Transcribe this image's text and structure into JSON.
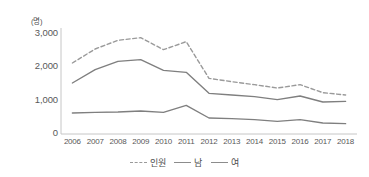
{
  "chart_data": {
    "type": "line",
    "title": "",
    "xlabel": "",
    "ylabel": "",
    "y_unit_label": "(명)",
    "categories": [
      "2006",
      "2007",
      "2008",
      "2009",
      "2010",
      "2011",
      "2012",
      "2013",
      "2014",
      "2015",
      "2016",
      "2017",
      "2018"
    ],
    "ylim": [
      0,
      3000
    ],
    "yticks": [
      "0",
      "1,000",
      "2,000",
      "3,000"
    ],
    "ytick_values": [
      0,
      1000,
      2000,
      3000
    ],
    "grid": false,
    "legend_position": "bottom",
    "series": [
      {
        "name": "인원",
        "style": "dashed",
        "color": "#9a9a9a",
        "values": [
          2100,
          2520,
          2780,
          2860,
          2500,
          2740,
          1640,
          1540,
          1450,
          1350,
          1450,
          1210,
          1140
        ]
      },
      {
        "name": "남",
        "style": "solid",
        "color": "#7f7f7f",
        "values": [
          1500,
          1900,
          2150,
          2200,
          1880,
          1820,
          1190,
          1140,
          1090,
          1000,
          1110,
          930,
          950
        ]
      },
      {
        "name": "여",
        "style": "solid",
        "color": "#7f7f7f",
        "values": [
          600,
          620,
          630,
          660,
          620,
          830,
          450,
          430,
          400,
          350,
          400,
          300,
          280
        ]
      }
    ]
  },
  "axis": {
    "unit": "(명)",
    "y_labels": [
      "3,000",
      "2,000",
      "1,000",
      "0"
    ],
    "x_labels": [
      "2006",
      "2007",
      "2008",
      "2009",
      "2010",
      "2011",
      "2012",
      "2013",
      "2014",
      "2015",
      "2016",
      "2017",
      "2018"
    ]
  },
  "legend": {
    "items": [
      {
        "label": "인원",
        "style": "dashed"
      },
      {
        "label": "남",
        "style": "solid"
      },
      {
        "label": "여",
        "style": "solid"
      }
    ]
  },
  "colors": {
    "axis_line": "#bfbfbf",
    "tick_text": "#595959",
    "series_solid": "#7f7f7f",
    "series_dashed": "#9a9a9a",
    "background": "#ffffff"
  }
}
